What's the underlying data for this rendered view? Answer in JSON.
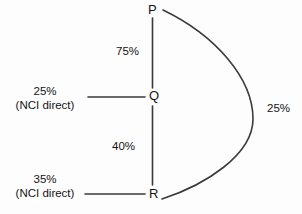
{
  "diagram": {
    "type": "node-link-flow-diagram",
    "nodes": [
      {
        "id": "P",
        "label": "P"
      },
      {
        "id": "Q",
        "label": "Q"
      },
      {
        "id": "R",
        "label": "R"
      }
    ],
    "edges": [
      {
        "id": "pq",
        "from": "P",
        "to": "Q",
        "label": "75%",
        "shape": "straight-vertical"
      },
      {
        "id": "qr",
        "from": "Q",
        "to": "R",
        "label": "40%",
        "shape": "straight-vertical"
      },
      {
        "id": "pr-curve",
        "from": "P",
        "to": "R",
        "label": "25%",
        "shape": "curve-right-bulge"
      },
      {
        "id": "q-inflow",
        "from": "external",
        "to": "Q",
        "label": "25%",
        "sublabel": "(NCI direct)",
        "shape": "straight-horizontal"
      },
      {
        "id": "r-inflow",
        "from": "external",
        "to": "R",
        "label": "35%",
        "sublabel": "(NCI direct)",
        "shape": "straight-horizontal"
      }
    ],
    "labels": {
      "node_p": "P",
      "node_q": "Q",
      "node_r": "R",
      "edge_pq": "75%",
      "edge_qr": "40%",
      "edge_pr_curve": "25%",
      "inflow_q_percent": "25%",
      "inflow_q_note": "(NCI direct)",
      "inflow_r_percent": "35%",
      "inflow_r_note": "(NCI direct)"
    },
    "colors": {
      "background": "#fdfdfd",
      "stroke": "#3a3a3a",
      "text": "#141414"
    }
  }
}
